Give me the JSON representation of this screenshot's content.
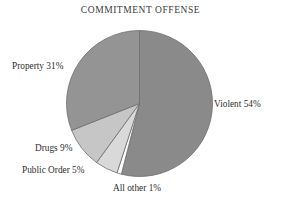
{
  "chart_data": {
    "type": "pie",
    "title": "COMMITMENT OFFENSE",
    "xlabel": "",
    "ylabel": "",
    "grid": false,
    "legend_position": "none",
    "labels_position": "outside-callout",
    "start_angle_deg": 0,
    "direction": "clockwise",
    "categories": [
      "Violent",
      "All other",
      "Public Order",
      "Drugs",
      "Property"
    ],
    "values": [
      54,
      1,
      5,
      9,
      31
    ],
    "value_unit": "percent",
    "slices": [
      {
        "name": "Violent",
        "value": 54,
        "label": "Violent 54%",
        "color": "#8a8a8a"
      },
      {
        "name": "All other",
        "value": 1,
        "label": "All other 1%",
        "color": "#fdfdfd"
      },
      {
        "name": "Public Order",
        "value": 5,
        "label": "Public Order 5%",
        "color": "#d9d9d9"
      },
      {
        "name": "Drugs",
        "value": 9,
        "label": "Drugs 9%",
        "color": "#c6c6c6"
      },
      {
        "name": "Property",
        "value": 31,
        "label": "Property 31%",
        "color": "#949494"
      }
    ],
    "total": 100,
    "annotations": []
  },
  "style": {
    "background": "#ffffff",
    "title_color": "#3a3a3a",
    "label_color": "#2f2f2f",
    "outline_color": "#6e6e6e"
  }
}
